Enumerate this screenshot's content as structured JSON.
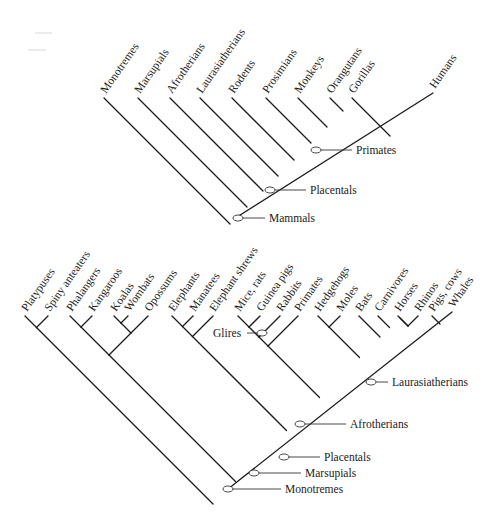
{
  "figure": {
    "line_color": "#1a1a1a",
    "background": "#ffffff"
  },
  "top_tree": {
    "tips": [
      {
        "label": "Monotremes",
        "x": 104,
        "y": 98
      },
      {
        "label": "Marsupials",
        "x": 138,
        "y": 98
      },
      {
        "label": "Afrotherians",
        "x": 170,
        "y": 98
      },
      {
        "label": "Laurasiatherians",
        "x": 200,
        "y": 98
      },
      {
        "label": "Rodents",
        "x": 232,
        "y": 98
      },
      {
        "label": "Prosimians",
        "x": 266,
        "y": 98
      },
      {
        "label": "Monkeys",
        "x": 298,
        "y": 98
      },
      {
        "label": "Orangutans",
        "x": 330,
        "y": 98
      },
      {
        "label": "Gorillas",
        "x": 352,
        "y": 98
      },
      {
        "label": "Humans",
        "x": 433,
        "y": 93
      }
    ],
    "root": {
      "x": 237,
      "y": 217
    },
    "node_labels": [
      {
        "label": "Primates",
        "oval_x": 316,
        "oval_y": 150,
        "text_x": 356,
        "text_y": 154
      },
      {
        "label": "Placentals",
        "oval_x": 270,
        "oval_y": 190,
        "text_x": 310,
        "text_y": 194
      },
      {
        "label": "Mammals",
        "oval_x": 238,
        "oval_y": 218,
        "text_x": 269,
        "text_y": 222
      }
    ]
  },
  "bottom_tree": {
    "tips": [
      {
        "label": "Platypuses",
        "x": 25,
        "y": 316
      },
      {
        "label": "Spiny anteaters",
        "x": 48,
        "y": 316
      },
      {
        "label": "Phalangers",
        "x": 70,
        "y": 316
      },
      {
        "label": "Kangaroos",
        "x": 92,
        "y": 316
      },
      {
        "label": "Koalas",
        "x": 114,
        "y": 316
      },
      {
        "label": "Wombats",
        "x": 128,
        "y": 316
      },
      {
        "label": "Opossums",
        "x": 148,
        "y": 316
      },
      {
        "label": "Elephants",
        "x": 172,
        "y": 316
      },
      {
        "label": "Manatees",
        "x": 193,
        "y": 316
      },
      {
        "label": "Elephant shrews",
        "x": 213,
        "y": 316
      },
      {
        "label": "Mice, rats",
        "x": 238,
        "y": 316
      },
      {
        "label": "Guinea pigs",
        "x": 260,
        "y": 316
      },
      {
        "label": "Rabbits",
        "x": 280,
        "y": 316
      },
      {
        "label": "Primates",
        "x": 298,
        "y": 316
      },
      {
        "label": "Hedgehogs",
        "x": 318,
        "y": 316
      },
      {
        "label": "Moles",
        "x": 340,
        "y": 316
      },
      {
        "label": "Bats",
        "x": 359,
        "y": 316
      },
      {
        "label": "Carnivores",
        "x": 378,
        "y": 316
      },
      {
        "label": "Horses",
        "x": 398,
        "y": 316
      },
      {
        "label": "Rhinos",
        "x": 418,
        "y": 316
      },
      {
        "label": "Pigs, cows",
        "x": 432,
        "y": 316
      },
      {
        "label": "Whales",
        "x": 452,
        "y": 312
      }
    ],
    "root": {
      "x": 228,
      "y": 489
    },
    "node_labels": [
      {
        "label": "Glires",
        "oval_x": 262,
        "oval_y": 333,
        "text_x": 215,
        "text_y": 337,
        "side": "left"
      },
      {
        "label": "Laurasiatherians",
        "oval_x": 371,
        "oval_y": 382,
        "text_x": 392,
        "text_y": 386
      },
      {
        "label": "Afrotherians",
        "oval_x": 300,
        "oval_y": 424,
        "text_x": 350,
        "text_y": 428
      },
      {
        "label": "Placentals",
        "oval_x": 284,
        "oval_y": 457,
        "text_x": 324,
        "text_y": 461
      },
      {
        "label": "Marsupials",
        "oval_x": 254,
        "oval_y": 473,
        "text_x": 305,
        "text_y": 477
      },
      {
        "label": "Monotremes",
        "oval_x": 228,
        "oval_y": 489,
        "text_x": 285,
        "text_y": 493
      }
    ]
  }
}
